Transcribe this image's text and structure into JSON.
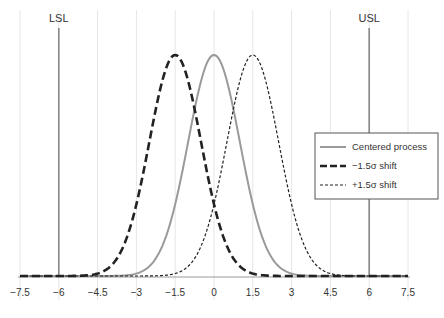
{
  "chart_data": {
    "type": "line",
    "title": "",
    "xlabel": "",
    "ylabel": "",
    "xlim": [
      -7.5,
      7.5
    ],
    "x_ticks": [
      "-7.5",
      "-6",
      "-4.5",
      "-3",
      "-1.5",
      "0",
      "1.5",
      "3",
      "4.5",
      "6",
      "7.5"
    ],
    "x_tick_values": [
      -7.5,
      -6,
      -4.5,
      -3,
      -1.5,
      0,
      1.5,
      3,
      4.5,
      6,
      7.5
    ],
    "grid": "vertical",
    "legend_position": "right",
    "spec_limits": [
      {
        "label": "LSL",
        "x": -6
      },
      {
        "label": "USL",
        "x": 6
      }
    ],
    "series": [
      {
        "name": "Centered process",
        "distribution": "normal",
        "mean": 0,
        "sd": 1,
        "style": "solid",
        "color": "#9a9a9a"
      },
      {
        "name": "−1.5σ shift",
        "distribution": "normal",
        "mean": -1.5,
        "sd": 1,
        "style": "long-dash",
        "color": "#222222"
      },
      {
        "name": "+1.5σ shift",
        "distribution": "normal",
        "mean": 1.5,
        "sd": 1,
        "style": "short-dash",
        "color": "#222222"
      }
    ]
  }
}
